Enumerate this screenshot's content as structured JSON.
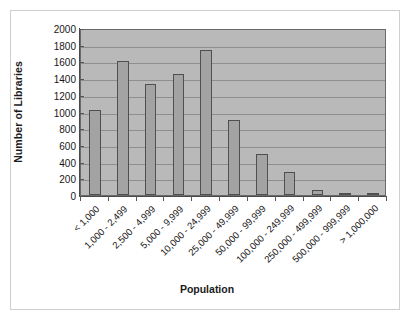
{
  "chart_data": {
    "type": "bar",
    "title": "",
    "xlabel": "Population",
    "ylabel": "Number of Libraries",
    "categories": [
      "< 1,000",
      "1,000 - 2,499",
      "2,500 - 4,999",
      "5,000 - 9,999",
      "10,000 - 24,999",
      "25,000 - 49,999",
      "50,000 - 99,999",
      "100,000 - 249,999",
      "250,000 - 499,999",
      "500,000 - 999,999",
      "> 1,000,000"
    ],
    "values": [
      1020,
      1610,
      1325,
      1450,
      1740,
      895,
      495,
      280,
      55,
      25,
      15
    ],
    "ylim": [
      0,
      2000
    ],
    "ytick_labels": [
      "2000",
      "1800",
      "1600",
      "1400",
      "1200",
      "1000",
      "800",
      "600",
      "400",
      "200",
      "0"
    ],
    "ytick_values": [
      2000,
      1800,
      1600,
      1400,
      1200,
      1000,
      800,
      600,
      400,
      200,
      0
    ],
    "ytick_step": 200,
    "grid": true,
    "legend": "none",
    "colors": {
      "plot_background": "#b9b9b9",
      "bar_fill": "#a3a3a3",
      "bar_border": "#4f4f4f",
      "gridline": "#8e8e8e",
      "axis": "#4a4a4a",
      "text": "#151515",
      "figure_background": "#ffffff",
      "outer_frame": "#cfcfcf"
    }
  }
}
